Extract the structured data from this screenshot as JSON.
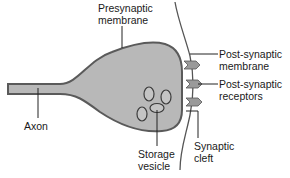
{
  "diagram": {
    "type": "synapse",
    "colors": {
      "neuron_fill": "#b8b8b8",
      "neuron_outline": "#5a5a5a",
      "receptor_fill": "#9a9a9a",
      "line": "#333333",
      "text": "#1a1a1a"
    },
    "labels": {
      "presynaptic_membrane": [
        "Presynaptic",
        "membrane"
      ],
      "axon": "Axon",
      "storage_vesicle": [
        "Storage",
        "vesicle"
      ],
      "postsynaptic_membrane": [
        "Post-synaptic",
        "membrane"
      ],
      "postsynaptic_receptors": [
        "Post-synaptic",
        "receptors"
      ],
      "synaptic_cleft": [
        "Synaptic",
        "cleft"
      ]
    },
    "vesicle_count": 4,
    "receptor_count": 3
  }
}
